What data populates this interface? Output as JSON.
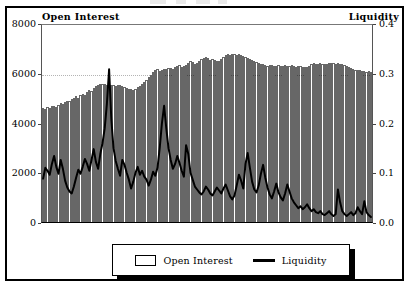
{
  "chart_data": {
    "type": "bar",
    "title": "",
    "subtitle": "",
    "xlabel": "",
    "ylabel": "Open Interest",
    "y2label": "Liquidity",
    "grid": "horizontal-dotted-at-6000",
    "legend_position": "bottom-center",
    "ylim": [
      0,
      8000
    ],
    "y2lim": [
      0.0,
      0.4
    ],
    "yticks": [
      "0",
      "2000",
      "4000",
      "6000",
      "8000"
    ],
    "ytick_values": [
      0,
      2000,
      4000,
      6000,
      8000
    ],
    "y2ticks": [
      "0.0",
      "0.1",
      "0.2",
      "0.3",
      "0.4"
    ],
    "y2tick_values": [
      0.0,
      0.1,
      0.2,
      0.3,
      0.4
    ],
    "xticks": [],
    "series": [
      {
        "name": "Open Interest",
        "type": "bar",
        "axis": "left",
        "color": "#000000",
        "fill": "#ffffff",
        "values": [
          4620,
          4580,
          4650,
          4600,
          4680,
          4700,
          4660,
          4720,
          4800,
          4760,
          4850,
          4900,
          4880,
          4960,
          5020,
          5080,
          5000,
          5120,
          5180,
          5150,
          5260,
          5320,
          5280,
          5420,
          5500,
          5560,
          5600,
          5580,
          5600,
          5560,
          5580,
          5560,
          5540,
          5520,
          5560,
          5540,
          5500,
          5460,
          5420,
          5400,
          5380,
          5360,
          5400,
          5460,
          5520,
          5600,
          5680,
          5760,
          5880,
          5960,
          6060,
          6140,
          6180,
          6120,
          6160,
          6200,
          6180,
          6220,
          6240,
          6200,
          6260,
          6300,
          6340,
          6280,
          6320,
          6360,
          6420,
          6500,
          6460,
          6380,
          6440,
          6520,
          6580,
          6640,
          6700,
          6620,
          6560,
          6600,
          6540,
          6500,
          6520,
          6600,
          6680,
          6760,
          6800,
          6780,
          6820,
          6800,
          6760,
          6800,
          6780,
          6720,
          6680,
          6640,
          6600,
          6560,
          6520,
          6480,
          6440,
          6400,
          6380,
          6340,
          6320,
          6360,
          6340,
          6300,
          6320,
          6340,
          6300,
          6320,
          6340,
          6320,
          6300,
          6340,
          6320,
          6280,
          6300,
          6320,
          6280,
          6260,
          6280,
          6320,
          6380,
          6420,
          6400,
          6380,
          6420,
          6400,
          6380,
          6400,
          6420,
          6440,
          6420,
          6400,
          6420,
          6400,
          6380,
          6340,
          6300,
          6260,
          6220,
          6180,
          6160,
          6140,
          6160,
          6120,
          6100,
          6080,
          6100,
          6080
        ]
      },
      {
        "name": "Liquidity",
        "type": "line",
        "axis": "right",
        "color": "#000000",
        "values": [
          0.088,
          0.11,
          0.104,
          0.096,
          0.118,
          0.134,
          0.112,
          0.098,
          0.126,
          0.108,
          0.084,
          0.07,
          0.062,
          0.058,
          0.072,
          0.09,
          0.106,
          0.098,
          0.112,
          0.128,
          0.118,
          0.104,
          0.126,
          0.148,
          0.122,
          0.108,
          0.138,
          0.16,
          0.19,
          0.24,
          0.31,
          0.21,
          0.15,
          0.124,
          0.108,
          0.094,
          0.126,
          0.116,
          0.1,
          0.086,
          0.068,
          0.082,
          0.1,
          0.112,
          0.096,
          0.104,
          0.092,
          0.086,
          0.074,
          0.086,
          0.102,
          0.094,
          0.11,
          0.15,
          0.2,
          0.236,
          0.19,
          0.15,
          0.126,
          0.108,
          0.118,
          0.134,
          0.12,
          0.104,
          0.092,
          0.156,
          0.138,
          0.1,
          0.086,
          0.072,
          0.066,
          0.06,
          0.056,
          0.062,
          0.072,
          0.066,
          0.058,
          0.054,
          0.062,
          0.07,
          0.064,
          0.058,
          0.068,
          0.076,
          0.064,
          0.052,
          0.046,
          0.054,
          0.074,
          0.096,
          0.084,
          0.068,
          0.118,
          0.14,
          0.11,
          0.082,
          0.066,
          0.06,
          0.074,
          0.098,
          0.116,
          0.09,
          0.07,
          0.056,
          0.048,
          0.062,
          0.078,
          0.06,
          0.05,
          0.044,
          0.058,
          0.076,
          0.062,
          0.048,
          0.04,
          0.034,
          0.028,
          0.032,
          0.026,
          0.03,
          0.036,
          0.028,
          0.022,
          0.026,
          0.02,
          0.018,
          0.022,
          0.016,
          0.014,
          0.018,
          0.022,
          0.016,
          0.012,
          0.016,
          0.066,
          0.04,
          0.022,
          0.016,
          0.012,
          0.016,
          0.02,
          0.014,
          0.018,
          0.03,
          0.022,
          0.016,
          0.042,
          0.02,
          0.014,
          0.01
        ]
      }
    ],
    "annotations": []
  },
  "legend": {
    "entries": [
      {
        "label": "Open Interest",
        "marker": "box-swatch"
      },
      {
        "label": "Liquidity",
        "marker": "line-swatch"
      }
    ]
  },
  "axes": {
    "left_title": "Open Interest",
    "right_title": "Liquidity"
  },
  "colors": {
    "frame": "#000000",
    "plot_background": "#ffffff",
    "bar_outline": "#000000",
    "line": "#000000",
    "gridline": "#b4b4b4"
  }
}
